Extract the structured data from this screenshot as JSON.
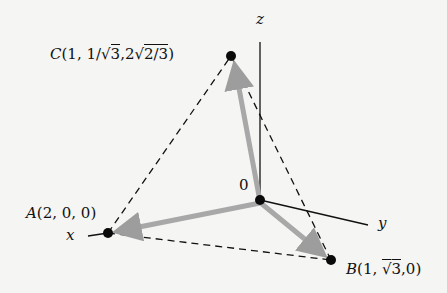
{
  "figure": {
    "type": "3d-vector-diagram",
    "axes": {
      "x_label": "x",
      "y_label": "y",
      "z_label": "z"
    },
    "origin": {
      "label": "0"
    },
    "points": {
      "A": {
        "label": "A(2, 0, 0)",
        "coords": [
          2,
          0,
          0
        ]
      },
      "B": {
        "label_prefix": "B(1, ",
        "label_sqrt": "3",
        "label_suffix": ",0)",
        "coords": [
          "1",
          "√3",
          "0"
        ]
      },
      "C": {
        "label_prefix": "C(1, 1/",
        "label_sqrt1": "3",
        "label_mid": ",2",
        "label_sqrt2": "2/3",
        "label_suffix": ")",
        "coords": [
          "1",
          "1/√3",
          "2√(2/3)"
        ]
      }
    },
    "vectors": [
      "OA",
      "OB",
      "OC"
    ],
    "dashed_edges": [
      "AB",
      "AC",
      "BC"
    ],
    "colors": {
      "vector": "#a8a8a8",
      "line": "#111111",
      "point": "#0a0a0a",
      "background": "#f5f5f3"
    }
  }
}
